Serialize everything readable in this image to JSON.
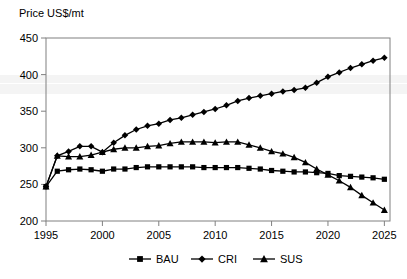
{
  "chart_data": {
    "type": "line",
    "title": "",
    "ylabel": "Price US$/mt",
    "xlabel": "",
    "xlim": [
      1995,
      2025.5
    ],
    "ylim": [
      200,
      450
    ],
    "ytick_step": 50,
    "yticks": [
      200,
      250,
      300,
      350,
      400,
      450
    ],
    "xticks": [
      1995,
      2000,
      2005,
      2010,
      2015,
      2020,
      2025
    ],
    "grid": false,
    "legend_position": "bottom",
    "x": [
      1995,
      1996,
      1997,
      1998,
      1999,
      2000,
      2001,
      2002,
      2003,
      2004,
      2005,
      2006,
      2007,
      2008,
      2009,
      2010,
      2011,
      2012,
      2013,
      2014,
      2015,
      2016,
      2017,
      2018,
      2019,
      2020,
      2021,
      2022,
      2023,
      2024,
      2025
    ],
    "series": [
      {
        "name": "BAU",
        "marker": "square",
        "values": [
          247,
          268,
          270,
          271,
          270,
          268,
          271,
          271,
          273,
          274,
          274,
          274,
          274,
          274,
          273,
          273,
          273,
          273,
          272,
          271,
          269,
          268,
          267,
          267,
          266,
          265,
          262,
          261,
          260,
          259,
          257
        ]
      },
      {
        "name": "CRI",
        "marker": "diamond",
        "values": [
          247,
          289,
          295,
          302,
          302,
          294,
          307,
          317,
          325,
          330,
          333,
          338,
          341,
          345,
          349,
          353,
          358,
          364,
          368,
          371,
          374,
          377,
          379,
          382,
          389,
          397,
          403,
          409,
          414,
          419,
          423
        ]
      },
      {
        "name": "SUS",
        "marker": "triangle",
        "values": [
          247,
          289,
          288,
          288,
          290,
          294,
          298,
          300,
          300,
          302,
          303,
          306,
          308,
          308,
          308,
          307,
          308,
          308,
          304,
          300,
          295,
          292,
          287,
          280,
          271,
          263,
          255,
          246,
          235,
          225,
          215
        ]
      }
    ]
  },
  "legend": {
    "items": [
      {
        "label": "BAU",
        "marker": "square"
      },
      {
        "label": "CRI",
        "marker": "diamond"
      },
      {
        "label": "SUS",
        "marker": "triangle"
      }
    ]
  }
}
